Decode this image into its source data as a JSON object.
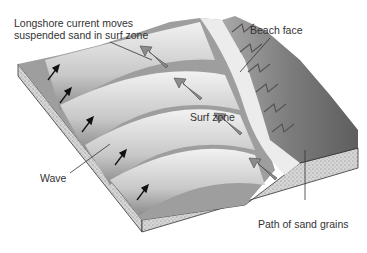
{
  "diagram": {
    "labels": {
      "longshore_line1": "Longshore current moves",
      "longshore_line2": "suspended sand in surf zone",
      "beach_face": "Beach face",
      "surf_zone": "Surf zone",
      "wave": "Wave",
      "path_sand": "Path of sand grains"
    },
    "colors": {
      "background": "#ffffff",
      "water_light": "#e6e6e6",
      "water_dark": "#9a9a9a",
      "beach": "#8a8a8a",
      "beach_dark": "#6e6e6e",
      "sediment": "#cfcfcf",
      "arrow_gray": "#8c8c8c",
      "arrow_black": "#111111",
      "text": "#333333"
    }
  }
}
